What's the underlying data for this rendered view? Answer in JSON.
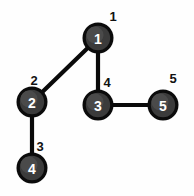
{
  "diagram": {
    "background_color": "#fefefe",
    "node_fill_color": "#3b3b3b",
    "node_outline_color": "#0b0b0b",
    "node_text_color": "#ffffff",
    "edge_color": "#0a0a0a",
    "label_color": "#111111",
    "nodes": [
      {
        "id": "n1",
        "inner_text": "1",
        "outer_label": "1",
        "cx": 98,
        "cy": 38,
        "r": 14,
        "label_x": 113,
        "label_y": 16
      },
      {
        "id": "n2",
        "inner_text": "2",
        "outer_label": "2",
        "cx": 32,
        "cy": 102,
        "r": 14,
        "label_x": 34,
        "label_y": 80
      },
      {
        "id": "n3",
        "inner_text": "3",
        "outer_label": "4",
        "cx": 98,
        "cy": 105,
        "r": 14,
        "label_x": 107,
        "label_y": 82
      },
      {
        "id": "n4",
        "inner_text": "4",
        "outer_label": "3",
        "cx": 32,
        "cy": 168,
        "r": 14,
        "label_x": 40,
        "label_y": 146
      },
      {
        "id": "n5",
        "inner_text": "5",
        "outer_label": "5",
        "cx": 163,
        "cy": 105,
        "r": 14,
        "label_x": 173,
        "label_y": 78
      }
    ],
    "edges": [
      {
        "id": "e1",
        "from": "n1",
        "to": "n2",
        "x1": 98,
        "y1": 38,
        "x2": 32,
        "y2": 102
      },
      {
        "id": "e2",
        "from": "n1",
        "to": "n3",
        "x1": 98,
        "y1": 38,
        "x2": 98,
        "y2": 105
      },
      {
        "id": "e3",
        "from": "n3",
        "to": "n5",
        "x1": 98,
        "y1": 105,
        "x2": 163,
        "y2": 105
      },
      {
        "id": "e4",
        "from": "n2",
        "to": "n4",
        "x1": 32,
        "y1": 102,
        "x2": 32,
        "y2": 168
      }
    ]
  }
}
